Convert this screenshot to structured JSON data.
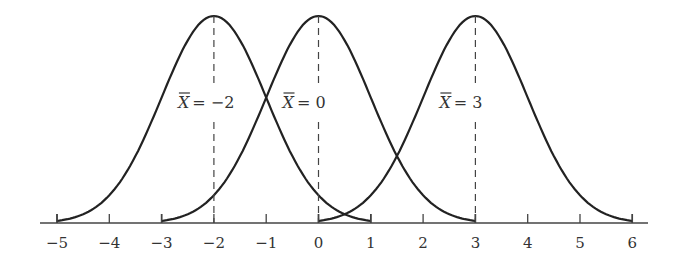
{
  "chart_data": {
    "type": "line",
    "title": "",
    "xlabel": "",
    "ylabel": "",
    "xlim": [
      -5,
      6
    ],
    "x_ticks": [
      -5,
      -4,
      -3,
      -2,
      -1,
      0,
      1,
      2,
      3,
      4,
      5,
      6
    ],
    "x_tick_labels": [
      "−5",
      "−4",
      "−3",
      "−2",
      "−1",
      "0",
      "1",
      "2",
      "3",
      "4",
      "5",
      "6"
    ],
    "grid": false,
    "legend": "none",
    "series": [
      {
        "name": "X̄ = −2",
        "mean": -2,
        "range": [
          -5,
          1
        ],
        "label": "= −2"
      },
      {
        "name": "X̄ = 0",
        "mean": 0,
        "range": [
          -3,
          3
        ],
        "label": "= 0"
      },
      {
        "name": "X̄ = 3",
        "mean": 3,
        "range": [
          0,
          6
        ],
        "label": "= 3"
      }
    ],
    "annotations": [
      "dashed vertical line at each mean"
    ]
  }
}
